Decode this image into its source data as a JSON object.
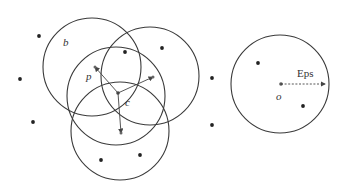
{
  "figure": {
    "type": "DBSCAN density-reachability illustration",
    "stroke_color": "#3a3a3a",
    "point_color": "#222222",
    "circles": [
      {
        "id": "circle-b",
        "cx": 92,
        "cy": 67,
        "r": 49
      },
      {
        "id": "circle-top-right",
        "cx": 150,
        "cy": 76,
        "r": 49
      },
      {
        "id": "circle-p",
        "cx": 116,
        "cy": 96,
        "r": 49
      },
      {
        "id": "circle-bottom",
        "cx": 120,
        "cy": 131,
        "r": 49
      },
      {
        "id": "circle-o",
        "cx": 280,
        "cy": 84,
        "r": 49
      }
    ],
    "points": [
      {
        "x": 39,
        "y": 36
      },
      {
        "x": 125,
        "y": 52
      },
      {
        "x": 162,
        "y": 48
      },
      {
        "x": 20,
        "y": 79
      },
      {
        "x": 33,
        "y": 122
      },
      {
        "x": 212,
        "y": 78
      },
      {
        "x": 212,
        "y": 125
      },
      {
        "x": 101,
        "y": 160
      },
      {
        "x": 140,
        "y": 155
      },
      {
        "x": 258,
        "y": 63
      },
      {
        "x": 303,
        "y": 106
      }
    ],
    "labels": {
      "b": "b",
      "p": "p",
      "c": "c",
      "o": "o",
      "eps": "Eps"
    },
    "center_c": {
      "x": 118,
      "y": 93
    },
    "arrows_from_c": [
      {
        "x": 95,
        "y": 67
      },
      {
        "x": 153,
        "y": 77
      },
      {
        "x": 121,
        "y": 133
      }
    ],
    "eps_arrow": {
      "x1": 281,
      "y1": 84,
      "x2": 327,
      "y2": 84
    }
  }
}
